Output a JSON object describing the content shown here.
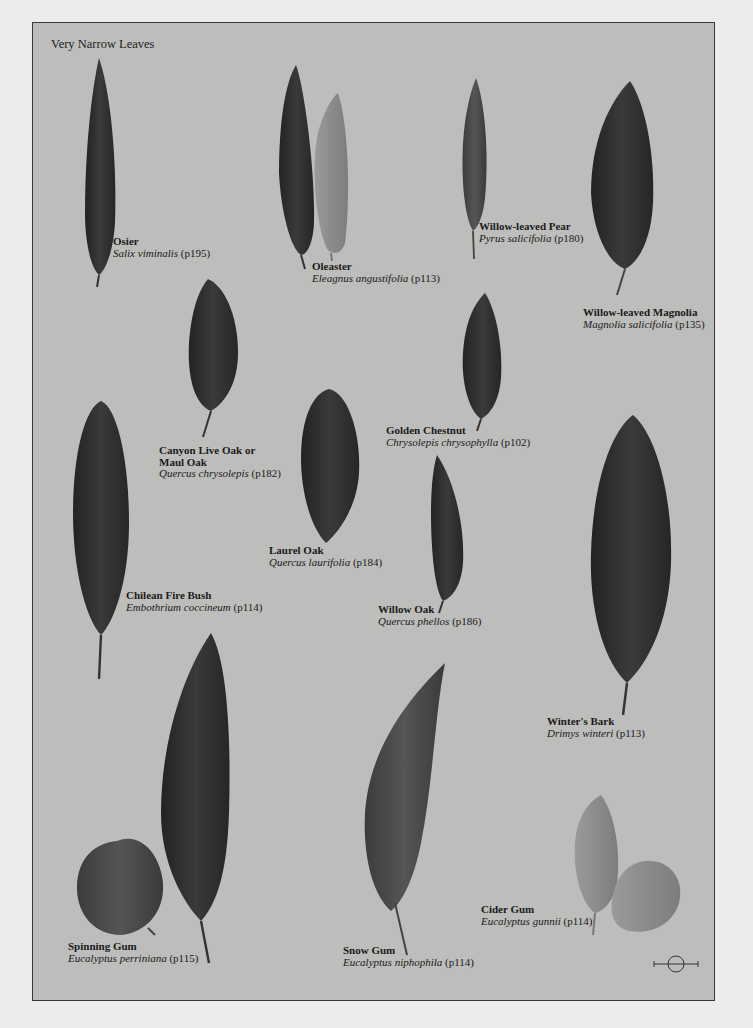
{
  "plate": {
    "title": "Very Narrow Leaves",
    "background_color": "#bdbdbb",
    "leaf_color_dark": "#2e2e2e",
    "leaf_color_light": "#8e8e8c"
  },
  "specimens": [
    {
      "common": "Osier",
      "scientific": "Salix viminalis",
      "page": "(p195)"
    },
    {
      "common": "Oleaster",
      "scientific": "Eleagnus angustifolia",
      "page": "(p113)"
    },
    {
      "common": "Willow-leaved Pear",
      "scientific": "Pyrus salicifolia",
      "page": "(p180)"
    },
    {
      "common": "Willow-leaved Magnolia",
      "scientific": "Magnolia salicifolia",
      "page": "(p135)"
    },
    {
      "common": "Canyon Live Oak or",
      "common2": "Maul Oak",
      "scientific": "Quercus chrysolepis",
      "page": "(p182)"
    },
    {
      "common": "Golden Chestnut",
      "scientific": "Chrysolepis chrysophylla",
      "page": "(p102)"
    },
    {
      "common": "Laurel Oak",
      "scientific": "Quercus laurifolia",
      "page": "(p184)"
    },
    {
      "common": "Chilean Fire Bush",
      "scientific": "Embothrium coccineum",
      "page": "(p114)"
    },
    {
      "common": "Willow Oak",
      "scientific": "Quercus phellos",
      "page": "(p186)"
    },
    {
      "common": "Winter's Bark",
      "scientific": "Drimys winteri",
      "page": "(p113)"
    },
    {
      "common": "Spinning Gum",
      "scientific": "Eucalyptus perriniana",
      "page": "(p115)"
    },
    {
      "common": "Snow Gum",
      "scientific": "Eucalyptus niphophila",
      "page": "(p114)"
    },
    {
      "common": "Cider Gum",
      "scientific": "Eucalyptus gunnii",
      "page": "(p114)"
    }
  ],
  "scale_icon": "scale-bar-circle-icon"
}
